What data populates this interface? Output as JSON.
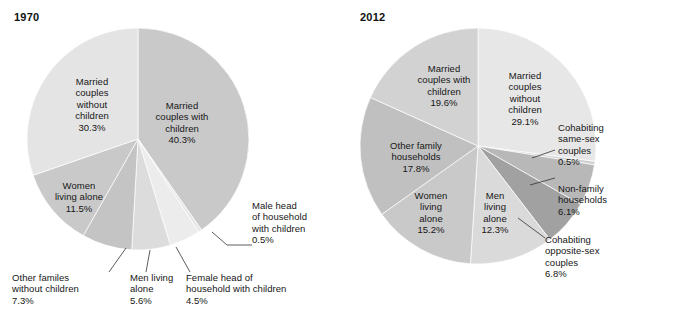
{
  "figure": {
    "background_color": "#ffffff",
    "text_color": "#161616"
  },
  "charts": [
    {
      "title": "1970",
      "type": "pie",
      "slices": [
        {
          "label": "Married couples with children",
          "value": 40.3,
          "value_label": "40.3%",
          "color": "#c9c9c9",
          "label_text": "Married\ncouples with\nchildren\n40.3%"
        },
        {
          "label": "Male head of household with children",
          "value": 0.5,
          "value_label": "0.5%",
          "color": "#e6e6e6",
          "label_text": "Male head\nof household\nwith children\n0.5%"
        },
        {
          "label": "Female head of household with children",
          "value": 4.5,
          "value_label": "4.5%",
          "color": "#ececec",
          "label_text": "Female head of\nhousehold with children\n4.5%"
        },
        {
          "label": "Men living alone",
          "value": 5.6,
          "value_label": "5.6%",
          "color": "#dcdcdc",
          "label_text": "Men living\nalone\n5.6%"
        },
        {
          "label": "Other familes without children",
          "value": 7.3,
          "value_label": "7.3%",
          "color": "#c4c4c4",
          "label_text": "Other familes\nwithout children\n7.3%"
        },
        {
          "label": "Women living alone",
          "value": 11.5,
          "value_label": "11.5%",
          "color": "#c9c9c9",
          "label_text": "Women\nliving alone\n11.5%"
        },
        {
          "label": "Married couples without children",
          "value": 30.3,
          "value_label": "30.3%",
          "color": "#e4e4e4",
          "label_text": "Married\ncouples\nwithout\nchildren\n30.3%"
        }
      ]
    },
    {
      "title": "2012",
      "type": "pie",
      "slices": [
        {
          "label": "Married couples without children",
          "value": 29.1,
          "value_label": "29.1%",
          "color": "#e7e7e7",
          "label_text": "Married\ncouples\nwithout\nchildren\n29.1%"
        },
        {
          "label": "Cohabiting same-sex couples",
          "value": 0.5,
          "value_label": "0.5%",
          "color": "#cfcfcf",
          "label_text": "Cohabiting\nsame-sex\ncouples\n0.5%"
        },
        {
          "label": "Non-family households",
          "value": 6.1,
          "value_label": "6.1%",
          "color": "#b8b8b8",
          "label_text": "Non-family\nhouseholds\n6.1%"
        },
        {
          "label": "Cohabiting opposite-sex couples",
          "value": 6.8,
          "value_label": "6.8%",
          "color": "#a1a1a1",
          "label_text": "Cohabiting\nopposite-sex\ncouples\n6.8%"
        },
        {
          "label": "Men living alone",
          "value": 12.3,
          "value_label": "12.3%",
          "color": "#dadada",
          "label_text": "Men\nliving\nalone\n12.3%"
        },
        {
          "label": "Women living alone",
          "value": 15.2,
          "value_label": "15.2%",
          "color": "#c9c9c9",
          "label_text": "Women\nliving\nalone\n15.2%"
        },
        {
          "label": "Other family households",
          "value": 17.8,
          "value_label": "17.8%",
          "color": "#c0c0c0",
          "label_text": "Other family\nhouseholds\n17.8%"
        },
        {
          "label": "Married couples with children",
          "value": 19.6,
          "value_label": "19.6%",
          "color": "#d2d2d2",
          "label_text": "Married\ncouples with\nchildren\n19.6%"
        }
      ]
    }
  ],
  "chart_data": [
    {
      "type": "pie",
      "title": "1970",
      "categories": [
        "Married couples with children",
        "Male head of household with children",
        "Female head of household with children",
        "Men living alone",
        "Other familes without children",
        "Women living alone",
        "Married couples without children"
      ],
      "values": [
        40.3,
        0.5,
        4.5,
        5.6,
        7.3,
        11.5,
        30.3
      ],
      "value_labels": [
        "40.3%",
        "0.5%",
        "4.5%",
        "5.6%",
        "7.3%",
        "11.5%",
        "30.3%"
      ],
      "colors": [
        "#c9c9c9",
        "#e6e6e6",
        "#ececec",
        "#dcdcdc",
        "#c4c4c4",
        "#c9c9c9",
        "#e4e4e4"
      ],
      "start_angle_deg": 0,
      "direction": "clockwise",
      "legend": "none",
      "xlabel": "",
      "ylabel": ""
    },
    {
      "type": "pie",
      "title": "2012",
      "categories": [
        "Married couples without children",
        "Cohabiting same-sex couples",
        "Non-family households",
        "Cohabiting opposite-sex couples",
        "Men living alone",
        "Women living alone",
        "Other family households",
        "Married couples with children"
      ],
      "values": [
        29.1,
        0.5,
        6.1,
        6.8,
        12.3,
        15.2,
        17.8,
        19.6
      ],
      "value_labels": [
        "29.1%",
        "0.5%",
        "6.1%",
        "6.8%",
        "12.3%",
        "15.2%",
        "17.8%",
        "19.6%"
      ],
      "colors": [
        "#e7e7e7",
        "#cfcfcf",
        "#b8b8b8",
        "#a1a1a1",
        "#dadada",
        "#c9c9c9",
        "#c0c0c0",
        "#d2d2d2"
      ],
      "start_angle_deg": 0,
      "direction": "clockwise",
      "legend": "none",
      "xlabel": "",
      "ylabel": ""
    }
  ]
}
